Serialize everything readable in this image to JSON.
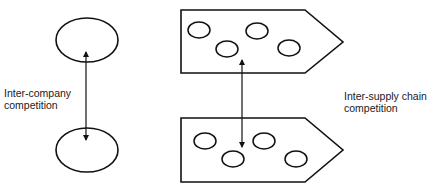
{
  "diagram": {
    "labels": {
      "inter_company": {
        "line1": "Inter-company",
        "line2": "competition"
      },
      "inter_supply_chain": {
        "line1": "Inter-supply chain",
        "line2": "competition"
      }
    },
    "nodes": {
      "company_top": {
        "shape": "ellipse",
        "cx": 87,
        "cy": 40,
        "rx": 31,
        "ry": 22
      },
      "company_bottom": {
        "shape": "ellipse",
        "cx": 87,
        "cy": 150,
        "rx": 31,
        "ry": 22
      },
      "supply_chain_top": {
        "shape": "pentagon-arrow",
        "members": [
          {
            "cx": 198,
            "cy": 30
          },
          {
            "cx": 226,
            "cy": 49
          },
          {
            "cx": 257,
            "cy": 30
          },
          {
            "cx": 289,
            "cy": 48
          }
        ]
      },
      "supply_chain_bottom": {
        "shape": "pentagon-arrow",
        "members": [
          {
            "cx": 204,
            "cy": 140
          },
          {
            "cx": 233,
            "cy": 159
          },
          {
            "cx": 264,
            "cy": 140
          },
          {
            "cx": 295,
            "cy": 159
          }
        ]
      }
    },
    "edges": [
      {
        "from": "company_top",
        "to": "company_bottom",
        "type": "double-arrow"
      },
      {
        "from": "supply_chain_top",
        "to": "supply_chain_bottom",
        "type": "double-arrow"
      }
    ],
    "stroke_color": "#111111"
  }
}
